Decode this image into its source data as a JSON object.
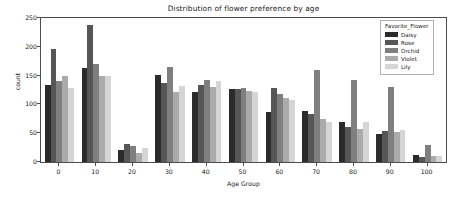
{
  "chart_data": {
    "type": "bar",
    "title": "Distribution of flower preference by age",
    "xlabel": "Age Group",
    "ylabel": "count",
    "categories": [
      "0",
      "10",
      "20",
      "30",
      "40",
      "50",
      "60",
      "70",
      "80",
      "90",
      "100"
    ],
    "ylim": [
      0,
      250
    ],
    "yticks": [
      0,
      50,
      100,
      150,
      200,
      250
    ],
    "grid": false,
    "legend_title": "Favorite_Flower",
    "legend_position": "upper right",
    "series": [
      {
        "name": "Daisy",
        "color": "#2b2b2b",
        "values": [
          133,
          164,
          20,
          151,
          122,
          126,
          86,
          88,
          69,
          48,
          13
        ]
      },
      {
        "name": "Rose",
        "color": "#565656",
        "values": [
          197,
          238,
          31,
          138,
          134,
          127,
          129,
          84,
          61,
          53,
          9
        ]
      },
      {
        "name": "Orchid",
        "color": "#7f7f7f",
        "values": [
          140,
          170,
          28,
          165,
          143,
          128,
          118,
          159,
          142,
          131,
          30
        ]
      },
      {
        "name": "Violet",
        "color": "#ababab",
        "values": [
          150,
          150,
          16,
          122,
          130,
          124,
          111,
          74,
          58,
          52,
          10
        ]
      },
      {
        "name": "Lily",
        "color": "#d5d5d5",
        "values": [
          128,
          150,
          25,
          132,
          141,
          121,
          107,
          69,
          69,
          56,
          11
        ]
      }
    ]
  }
}
